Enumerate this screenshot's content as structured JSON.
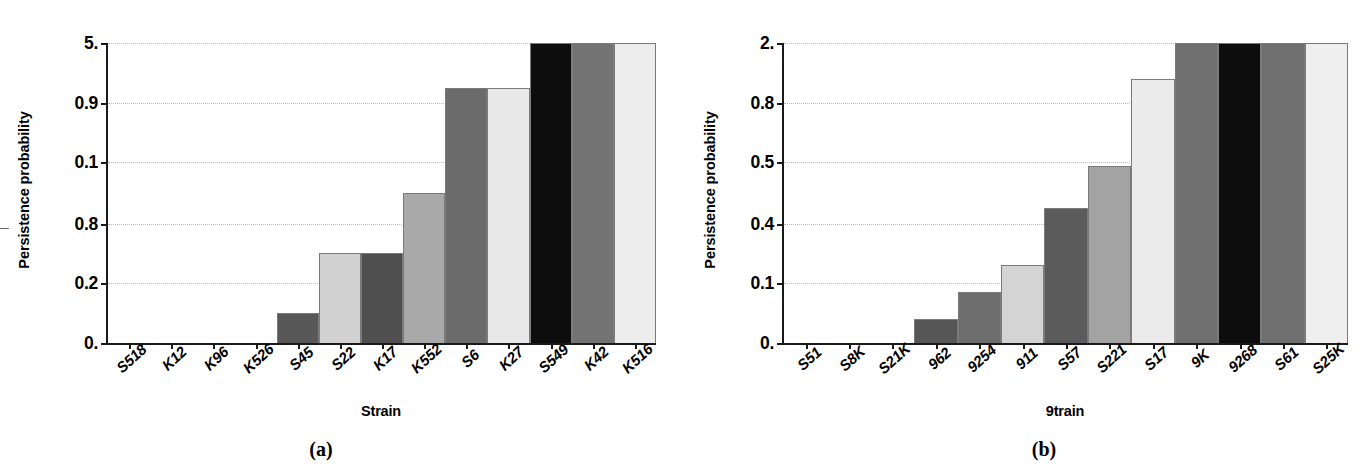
{
  "figure": {
    "panels": [
      {
        "id": "panel-a",
        "caption": "(a)",
        "ylabel": "Persistence probability",
        "xlabel": "Strain",
        "ytick_labels": [
          "5.",
          "0.9",
          "0.1",
          "0.8",
          "0.2",
          "0."
        ],
        "ytick_fracs": [
          1.0,
          0.8013,
          0.6026,
          0.3974,
          0.1987,
          0.0
        ]
      },
      {
        "id": "panel-b",
        "caption": "(b)",
        "ylabel": "Persistence probability",
        "xlabel": "9train",
        "ytick_labels": [
          "2.",
          "0.8",
          "0.5",
          "0.4",
          "0.1",
          "0."
        ],
        "ytick_fracs": [
          1.0,
          0.8013,
          0.6026,
          0.3974,
          0.1987,
          0.0
        ]
      }
    ]
  },
  "chart_data": [
    {
      "type": "bar",
      "panel": "(a)",
      "title": "",
      "xlabel": "Strain",
      "ylabel": "Persistence probability",
      "ylim": [
        0,
        1.0
      ],
      "grid": true,
      "legend": "none",
      "ytick_labels": [
        "5.",
        "0.9",
        "0.1",
        "0.8",
        "0.2",
        "0."
      ],
      "categories": [
        "S518",
        "K12",
        "K96",
        "K526",
        "S45",
        "S22",
        "K17",
        "K552",
        "S6",
        "K27",
        "S549",
        "K42",
        "K516"
      ],
      "values": [
        0,
        0,
        0,
        0,
        0.1,
        0.3,
        0.3,
        0.5,
        0.85,
        0.85,
        1.0,
        1.0,
        1.0
      ],
      "bar_colors": [
        "#5f5f5f",
        "#5f5f5f",
        "#5f5f5f",
        "#5f5f5f",
        "#585858",
        "#d2d2d2",
        "#4f4f4f",
        "#a9a9a9",
        "#6b6b6b",
        "#e8e8e8",
        "#0d0d0d",
        "#737373",
        "#ededed"
      ]
    },
    {
      "type": "bar",
      "panel": "(b)",
      "title": "",
      "xlabel": "9train",
      "ylabel": "Persistence probability",
      "ylim": [
        0,
        1.0
      ],
      "grid": true,
      "legend": "none",
      "ytick_labels": [
        "2.",
        "0.8",
        "0.5",
        "0.4",
        "0.1",
        "0."
      ],
      "categories": [
        "S51",
        "S8K",
        "S21K",
        "962",
        "9254",
        "911",
        "S57",
        "S221",
        "S17",
        "9K",
        "9268",
        "S61",
        "S25K"
      ],
      "values": [
        0,
        0,
        0,
        0.08,
        0.17,
        0.26,
        0.45,
        0.59,
        0.88,
        1.0,
        1.0,
        1.0,
        1.0
      ],
      "bar_colors": [
        "#5f5f5f",
        "#5f5f5f",
        "#5f5f5f",
        "#565656",
        "#6e6e6e",
        "#d4d4d4",
        "#5b5b5b",
        "#a3a3a3",
        "#ebebeb",
        "#6f6f6f",
        "#0d0d0d",
        "#6f6f6f",
        "#efefef"
      ]
    }
  ]
}
